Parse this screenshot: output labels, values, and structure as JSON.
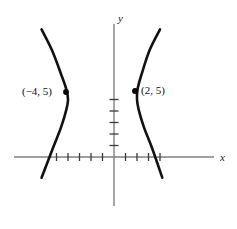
{
  "figure": {
    "kind": "math-graph",
    "background_color": "#ffffff",
    "curve_color": "#111111",
    "axis_color": "#808080",
    "point_color": "#000000",
    "top_edge_artifact": ". . . . . ."
  },
  "axes": {
    "x_label": "x",
    "y_label": "y",
    "origin_px": {
      "x": 114,
      "y": 157
    },
    "x_axis": {
      "x_start_px": 14,
      "x_end_px": 214,
      "y_px": 157
    },
    "y_axis": {
      "y_start_px": 24,
      "y_end_px": 206,
      "x_px": 114
    },
    "unit_px": 11.5,
    "x_ticks": [
      -5,
      -4,
      -3,
      -2,
      -1,
      1,
      2,
      3,
      4
    ],
    "y_ticks": [
      1,
      2,
      3,
      4,
      5
    ],
    "grid": false
  },
  "chart_data": {
    "type": "line",
    "title": "",
    "xlabel": "x",
    "ylabel": "y",
    "xlim": [
      -9,
      9
    ],
    "ylim": [
      -2,
      12
    ],
    "grid": false,
    "legend": "none",
    "series": [
      {
        "name": "left-branch",
        "opens": "left",
        "vertex": [
          -4,
          5
        ],
        "points": [
          [
            -6.3,
            11.1
          ],
          [
            -5.4,
            9.3
          ],
          [
            -4.6,
            7.2
          ],
          [
            -4.15,
            5.9
          ],
          [
            -4.0,
            5.0
          ],
          [
            -4.15,
            4.1
          ],
          [
            -4.6,
            2.6
          ],
          [
            -5.3,
            0.8
          ],
          [
            -6.3,
            -1.8
          ]
        ]
      },
      {
        "name": "right-branch",
        "opens": "right",
        "vertex": [
          2,
          5
        ],
        "points": [
          [
            4.0,
            11.1
          ],
          [
            3.1,
            9.3
          ],
          [
            2.4,
            7.2
          ],
          [
            2.05,
            5.9
          ],
          [
            2.0,
            5.0
          ],
          [
            2.15,
            4.1
          ],
          [
            2.6,
            2.6
          ],
          [
            3.3,
            0.8
          ],
          [
            4.2,
            -1.8
          ]
        ]
      }
    ],
    "annotations": [
      {
        "name": "left-vertex-point",
        "label": "(−4, 5)",
        "point": [
          -4,
          5
        ],
        "label_side": "left",
        "px": {
          "x": 66,
          "y": 92
        },
        "label_px": {
          "x": 22,
          "y": 95
        }
      },
      {
        "name": "right-vertex-point",
        "label": "(2, 5)",
        "point": [
          2,
          5
        ],
        "label_side": "right",
        "px": {
          "x": 135,
          "y": 91
        },
        "label_px": {
          "x": 141,
          "y": 94
        }
      }
    ]
  }
}
